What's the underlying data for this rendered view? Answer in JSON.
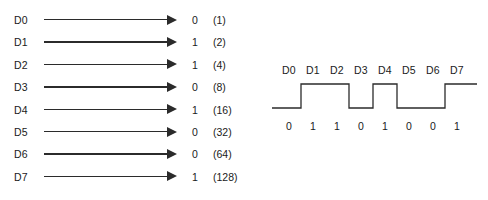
{
  "diagram": {
    "line_color": "#2b2b2b",
    "text_color": "#1a1a1a",
    "background_color": "#ffffff"
  },
  "parallel": {
    "rows": [
      {
        "label": "D0",
        "bit": "0",
        "weight": "(1)"
      },
      {
        "label": "D1",
        "bit": "1",
        "weight": "(2)"
      },
      {
        "label": "D2",
        "bit": "1",
        "weight": "(4)"
      },
      {
        "label": "D3",
        "bit": "0",
        "weight": "(8)"
      },
      {
        "label": "D4",
        "bit": "1",
        "weight": "(16)"
      },
      {
        "label": "D5",
        "bit": "0",
        "weight": "(32)"
      },
      {
        "label": "D6",
        "bit": "0",
        "weight": "(64)"
      },
      {
        "label": "D7",
        "bit": "1",
        "weight": "(128)"
      }
    ]
  },
  "serial": {
    "labels": [
      "D0",
      "D1",
      "D2",
      "D3",
      "D4",
      "D5",
      "D6",
      "D7"
    ],
    "bits": [
      "0",
      "1",
      "1",
      "0",
      "1",
      "0",
      "0",
      "1"
    ]
  },
  "chart_data": {
    "type": "line",
    "xlabel": "",
    "ylabel": "",
    "categories": [
      "D0",
      "D1",
      "D2",
      "D3",
      "D4",
      "D5",
      "D6",
      "D7"
    ],
    "values": [
      0,
      1,
      1,
      0,
      1,
      0,
      0,
      1
    ],
    "weights": [
      1,
      2,
      4,
      8,
      16,
      32,
      64,
      128
    ],
    "ylim": [
      0,
      1
    ],
    "grid": false,
    "legend": "none",
    "annotations": [
      "Digital waveform is drawn as a non-return-to-zero square wave; each bit occupies one equal time cell."
    ]
  }
}
